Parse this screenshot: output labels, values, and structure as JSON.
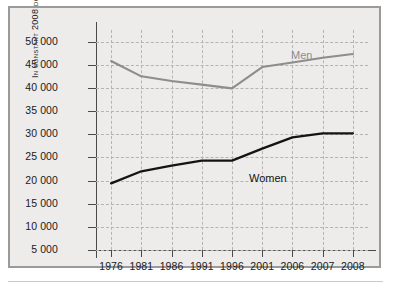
{
  "chart_data": {
    "type": "line",
    "title": "",
    "xlabel": "",
    "ylabel": "In constant 2008 dollars",
    "x": [
      "1976",
      "1981",
      "1986",
      "1991",
      "1996",
      "2001",
      "2006",
      "2007",
      "2008"
    ],
    "categories": [
      "1976",
      "1981",
      "1986",
      "1991",
      "1996",
      "2001",
      "2006",
      "2007",
      "2008"
    ],
    "ytick_labels": [
      "50 000",
      "45 000",
      "40 000",
      "35 000",
      "30 000",
      "25 000",
      "20 000",
      "15 000",
      "10 000",
      "5 000"
    ],
    "ytick_values": [
      50000,
      45000,
      40000,
      35000,
      30000,
      25000,
      20000,
      15000,
      10000,
      5000
    ],
    "ylim": [
      5000,
      52500
    ],
    "grid": true,
    "legend_position": "inline-annotation",
    "series": [
      {
        "name": "Men",
        "color": "#8d8d8d",
        "values": [
          45800,
          42500,
          41500,
          40700,
          39900,
          44500,
          45500,
          46500,
          47300
        ]
      },
      {
        "name": "Women",
        "color": "#141414",
        "values": [
          19400,
          22000,
          23200,
          24300,
          24300,
          26900,
          29300,
          30200,
          30200
        ]
      }
    ],
    "annotations": [
      {
        "text": "Men",
        "series": "Men"
      },
      {
        "text": "Women",
        "series": "Women"
      }
    ]
  },
  "axis": {
    "y_title": "In constant 2008 dollars"
  },
  "labels": {
    "men": "Men",
    "women": "Women"
  }
}
